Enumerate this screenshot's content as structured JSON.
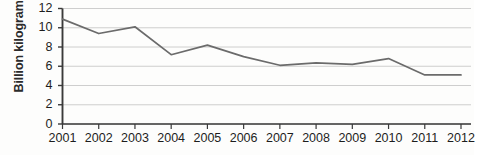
{
  "chart_data": {
    "type": "line",
    "title": "",
    "subtitle": "",
    "xlabel": "",
    "ylabel": "Billion kilograms",
    "categories": [
      "2001",
      "2002",
      "2003",
      "2004",
      "2005",
      "2006",
      "2007",
      "2008",
      "2009",
      "2010",
      "2011",
      "2012"
    ],
    "values": [
      10.9,
      9.4,
      10.1,
      7.2,
      8.2,
      7.0,
      6.1,
      6.35,
      6.2,
      6.8,
      5.1,
      5.1
    ],
    "series": [
      {
        "name": "Billion kilograms",
        "values": [
          10.9,
          9.4,
          10.1,
          7.2,
          8.2,
          7.0,
          6.1,
          6.35,
          6.2,
          6.8,
          5.1,
          5.1
        ]
      }
    ],
    "ylim": [
      0,
      12
    ],
    "ytick_labels": [
      "0",
      "2",
      "4",
      "6",
      "8",
      "10",
      "12"
    ],
    "ytick_values": [
      0,
      2,
      4,
      6,
      8,
      10,
      12
    ],
    "xtick_labels": [
      "2001",
      "2002",
      "2003",
      "2004",
      "2005",
      "2006",
      "2007",
      "2008",
      "2009",
      "2010",
      "2011",
      "2012"
    ],
    "grid": true,
    "grid_axis": "y",
    "legend": false,
    "legend_position": "none",
    "line_color": "#6b6b6b",
    "grid_color": "#c8c8c8",
    "axis_color": "#3a3a3a",
    "background_color": "#fdfdfc",
    "annotations": []
  },
  "axis": {
    "y_title": "Billion kilograms"
  }
}
